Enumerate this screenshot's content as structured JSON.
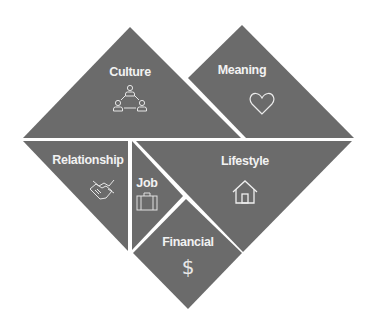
{
  "diagram": {
    "type": "heart-tangram",
    "fill_color": "#6b6b6b",
    "text_color": "#f2f2f2",
    "background": "#ffffff",
    "pieces": [
      {
        "id": "culture",
        "label": "Culture",
        "icon": "people-network-icon"
      },
      {
        "id": "meaning",
        "label": "Meaning",
        "icon": "heart-icon"
      },
      {
        "id": "relationship",
        "label": "Relationship",
        "icon": "handshake-icon"
      },
      {
        "id": "job",
        "label": "Job",
        "icon": "briefcase-icon"
      },
      {
        "id": "lifestyle",
        "label": "Lifestyle",
        "icon": "house-icon"
      },
      {
        "id": "financial",
        "label": "Financial",
        "icon": "dollar-icon",
        "glyph": "$"
      }
    ]
  }
}
